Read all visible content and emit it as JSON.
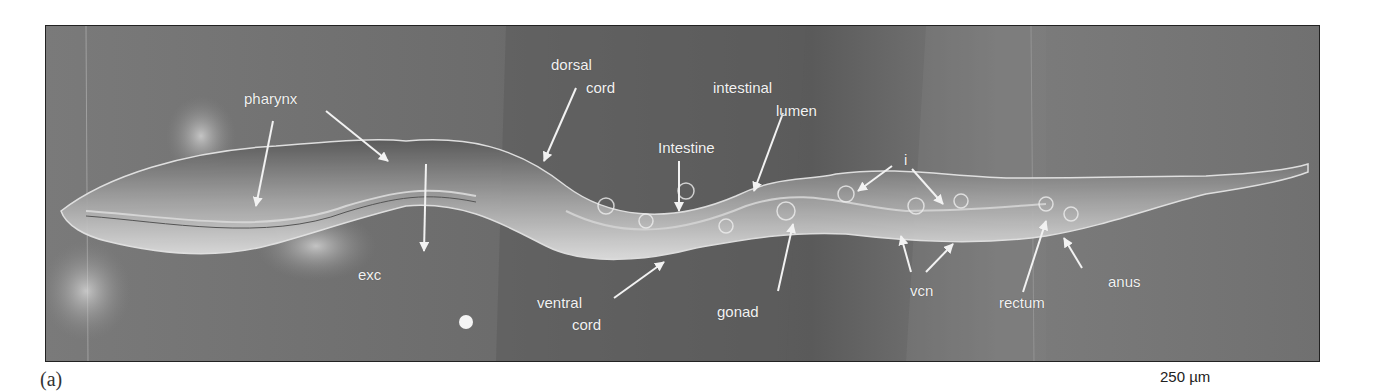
{
  "figure": {
    "panel_label": "(a)",
    "scale_bar_label": "250 µm",
    "colors": {
      "background": "#6f6f6f",
      "label": "#f2f2f2",
      "worm": "#9a9a9a"
    }
  },
  "labels": {
    "pharynx": "pharynx",
    "exc": "exc",
    "dorsal": "dorsal",
    "dorsal_cord": "cord",
    "ventral": "ventral",
    "ventral_cord": "cord",
    "intestine": "Intestine",
    "intestinal": "intestinal",
    "lumen": "lumen",
    "gonad": "gonad",
    "i": "i",
    "vcn": "vcn",
    "rectum": "rectum",
    "anus": "anus"
  }
}
